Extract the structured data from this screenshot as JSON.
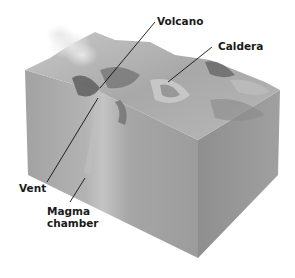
{
  "diagram": {
    "labels": [
      {
        "id": "volcano",
        "text": "Volcano"
      },
      {
        "id": "caldera",
        "text": "Caldera"
      },
      {
        "id": "vent",
        "text": "Vent"
      },
      {
        "id": "magma",
        "line1": "Magma",
        "line2": "chamber"
      }
    ],
    "colors": {
      "front_face": "#9a9a9a",
      "right_face": "#8a8a8a",
      "top_surface": "#b5b5b5",
      "leader_line": "#111111",
      "label_text": "#1a1a1a"
    }
  }
}
